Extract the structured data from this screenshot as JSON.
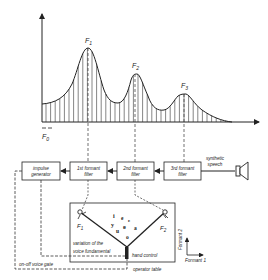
{
  "spectrum": {
    "peaks": [
      {
        "label": "F",
        "sub": "1",
        "x": 88,
        "y": 48
      },
      {
        "label": "F",
        "sub": "2",
        "x": 135,
        "y": 74
      },
      {
        "label": "F",
        "sub": "3",
        "x": 184,
        "y": 94
      }
    ],
    "fundamental_label": "F",
    "fundamental_sub": "0"
  },
  "blocks": {
    "impulse": [
      "impulse",
      "generator"
    ],
    "f1": [
      "1st formant",
      "filter"
    ],
    "f2": [
      "2nd formant",
      "filter"
    ],
    "f3": [
      "3rd formant",
      "filter"
    ]
  },
  "output": [
    "synthetic",
    "speech"
  ],
  "table": {
    "f1_label": "F",
    "f1_sub": "1",
    "f2_label": "F",
    "f2_sub": "2",
    "vowels": [
      "i",
      "e",
      "y",
      "ɛ",
      "ø",
      "a",
      "u",
      "o"
    ],
    "variation_label": [
      "variation of the",
      "voice fundamental"
    ],
    "hand_control": "hand control",
    "operator_table": "operator table",
    "voice_gate": "on-off voice gate"
  },
  "axes_legend": {
    "formant1": "Formant 1",
    "formant2": "Formant 2"
  }
}
